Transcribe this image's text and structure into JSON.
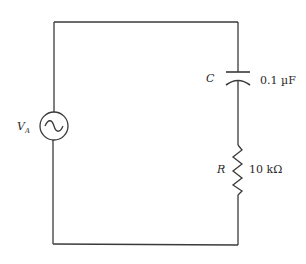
{
  "diagram": {
    "type": "circuit-schematic",
    "colors": {
      "wire": "#3a3a3a",
      "text": "#2a2a2a",
      "background": "#ffffff"
    },
    "source": {
      "symbol": "ac-voltage-source",
      "label_main": "V",
      "label_sub": "A"
    },
    "capacitor": {
      "label": "C",
      "value": "0.1 µF"
    },
    "resistor": {
      "label": "R",
      "value": "10 kΩ"
    }
  }
}
